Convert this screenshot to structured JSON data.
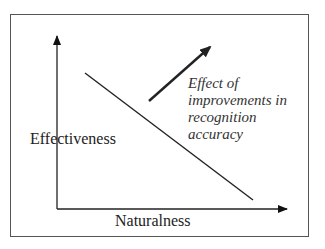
{
  "diagram": {
    "y_axis_label": "Effectiveness",
    "x_axis_label": "Naturalness",
    "annotation": {
      "lines": [
        "Effect of",
        "improvements in",
        "recognition",
        "accuracy"
      ]
    },
    "tradeoff_line": {
      "from": [
        85,
        73
      ],
      "to": [
        253,
        200
      ]
    },
    "improvement_arrow": {
      "from": [
        149,
        101
      ],
      "to": [
        212,
        45
      ]
    }
  }
}
